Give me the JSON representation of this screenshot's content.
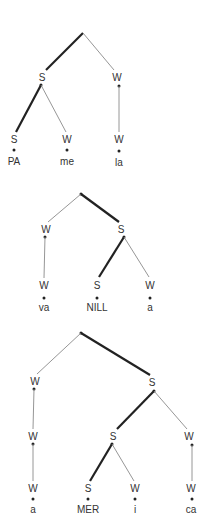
{
  "diagram": {
    "type": "metrical-trees",
    "trees": [
      {
        "word": "PAmela",
        "root": {
          "x": 83,
          "y": 33
        },
        "nodes": [
          {
            "id": "t1-s",
            "label": "S",
            "x": 42,
            "y": 78,
            "dot": [
              41,
              85
            ]
          },
          {
            "id": "t1-w",
            "label": "W",
            "x": 117,
            "y": 78,
            "dot": [
              119,
              86
            ]
          }
        ],
        "leaves": [
          {
            "label": "S",
            "syllable": "PA",
            "x": 14
          },
          {
            "label": "W",
            "syllable": "me",
            "x": 67
          },
          {
            "label": "W",
            "syllable": "la",
            "x": 119
          }
        ],
        "leaf_y": 140
      },
      {
        "word": "vaNILLa",
        "root": {
          "x": 81,
          "y": 194
        },
        "nodes": [
          {
            "id": "t2-w",
            "label": "W",
            "x": 46,
            "y": 230,
            "dot": [
              45,
              236
            ]
          },
          {
            "id": "t2-s",
            "label": "S",
            "x": 121,
            "y": 230,
            "dot": [
              124,
              237
            ]
          }
        ],
        "leaves": [
          {
            "label": "W",
            "syllable": "va",
            "x": 44
          },
          {
            "label": "S",
            "syllable": "NILL",
            "x": 97
          },
          {
            "label": "W",
            "syllable": "a",
            "x": 150
          }
        ],
        "leaf_y": 286
      },
      {
        "word": "aMERica",
        "root": {
          "x": 81,
          "y": 333
        },
        "nodes": [
          {
            "id": "t3-w",
            "label": "W",
            "x": 35,
            "y": 382,
            "dot": [
              34,
              389
            ]
          },
          {
            "id": "t3-s",
            "label": "S",
            "x": 152,
            "y": 383,
            "dot": [
              154,
              391
            ]
          },
          {
            "id": "t3-ww",
            "label": "W",
            "x": 33,
            "y": 437,
            "dot": [
              33,
              444
            ]
          },
          {
            "id": "t3-ss",
            "label": "S",
            "x": 113,
            "y": 437,
            "dot": [
              112,
              444
            ]
          },
          {
            "id": "t3-sw",
            "label": "W",
            "x": 189,
            "y": 437,
            "dot": [
              192,
              445
            ]
          }
        ],
        "leaves": [
          {
            "label": "W",
            "syllable": "a",
            "x": 33
          },
          {
            "label": "S",
            "syllable": "MER",
            "x": 88
          },
          {
            "label": "W",
            "syllable": "i",
            "x": 135
          },
          {
            "label": "W",
            "syllable": "ca",
            "x": 191
          }
        ],
        "leaf_y": 489
      }
    ]
  },
  "labels": {
    "t1": {
      "s": "S",
      "w": "W",
      "leaf1": "S",
      "leaf2": "W",
      "leaf3": "W",
      "syl1": "PA",
      "syl2": "me",
      "syl3": "la"
    },
    "t2": {
      "w": "W",
      "s": "S",
      "leaf1": "W",
      "leaf2": "S",
      "leaf3": "W",
      "syl1": "va",
      "syl2": "NILL",
      "syl3": "a"
    },
    "t3": {
      "w": "W",
      "s": "S",
      "ww": "W",
      "ss": "S",
      "sw": "W",
      "leaf1": "W",
      "leaf2": "S",
      "leaf3": "W",
      "leaf4": "W",
      "syl1": "a",
      "syl2": "MER",
      "syl3": "i",
      "syl4": "ca"
    }
  }
}
